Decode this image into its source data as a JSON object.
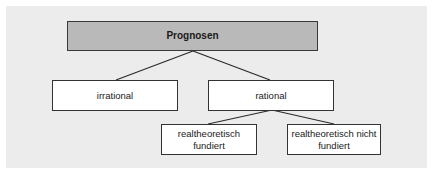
{
  "diagram": {
    "type": "tree",
    "colors": {
      "background_panel": "#ececec",
      "root_fill": "#b9b9b9",
      "node_fill": "#ffffff",
      "border": "#333333"
    },
    "nodes": {
      "root": {
        "label": "Prognosen"
      },
      "irrational": {
        "label": "irrational"
      },
      "rational": {
        "label": "rational"
      },
      "rt_fundiert": {
        "label_line1": "realtheoretisch",
        "label_line2": "fundiert"
      },
      "rt_nicht_fundiert": {
        "label_line1": "realtheoretisch nicht",
        "label_line2": "fundiert"
      }
    },
    "edges": [
      {
        "from": "Prognosen",
        "to": "irrational"
      },
      {
        "from": "Prognosen",
        "to": "rational"
      },
      {
        "from": "rational",
        "to": "realtheoretisch fundiert"
      },
      {
        "from": "rational",
        "to": "realtheoretisch nicht fundiert"
      }
    ]
  }
}
